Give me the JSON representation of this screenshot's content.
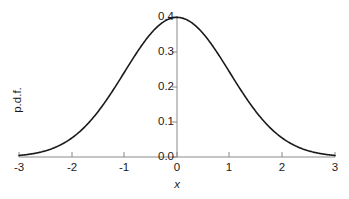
{
  "chart_data": {
    "type": "line",
    "title": "",
    "subtitle": "",
    "xlabel": "x",
    "ylabel": "p.d.f.",
    "xlim": [
      -3,
      3
    ],
    "ylim": [
      0.0,
      0.4
    ],
    "xticks": [
      -3,
      -2,
      -1,
      0,
      1,
      2,
      3
    ],
    "xtick_labels": [
      "-3",
      "-2",
      "-1",
      "0",
      "1",
      "2",
      "3"
    ],
    "yticks": [
      0.0,
      0.1,
      0.2,
      0.3,
      0.4
    ],
    "ytick_labels": [
      "0.0",
      "0.1",
      "0.2",
      "0.3",
      "0.4"
    ],
    "grid": false,
    "legend": null,
    "annotations": [],
    "line_color": "#1a1a1a",
    "axis_color": "#808080",
    "background": "#ffffff",
    "series": [
      {
        "name": "standard normal pdf",
        "formula": "(1/sqrt(2*pi))*exp(-x^2/2)",
        "x": [
          -3.0,
          -2.8,
          -2.6,
          -2.4,
          -2.2,
          -2.0,
          -1.8,
          -1.6,
          -1.4,
          -1.2,
          -1.0,
          -0.8,
          -0.6,
          -0.4,
          -0.2,
          0.0,
          0.2,
          0.4,
          0.6,
          0.8,
          1.0,
          1.2,
          1.4,
          1.6,
          1.8,
          2.0,
          2.2,
          2.4,
          2.6,
          2.8,
          3.0
        ],
        "values": [
          0.0044,
          0.0079,
          0.0136,
          0.0224,
          0.0355,
          0.054,
          0.079,
          0.1109,
          0.1497,
          0.1942,
          0.242,
          0.2897,
          0.3332,
          0.3683,
          0.391,
          0.3989,
          0.391,
          0.3683,
          0.3332,
          0.2897,
          0.242,
          0.1942,
          0.1497,
          0.1109,
          0.079,
          0.054,
          0.0355,
          0.0224,
          0.0136,
          0.0079,
          0.0044
        ]
      }
    ],
    "peak_value": 0.3989,
    "peak_x": 0.0
  }
}
